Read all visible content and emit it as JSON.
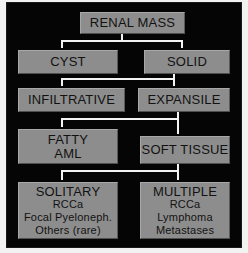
{
  "diagram": {
    "colors": {
      "background": "#050505",
      "node_fill": "#8d8d8d",
      "node_text": "#121212",
      "connector": "#f4f4f4",
      "page": "#ffffff"
    },
    "nodes": [
      {
        "id": "renal-mass",
        "name": "renal-mass",
        "main": "RENAL MASS",
        "sub": []
      },
      {
        "id": "cyst",
        "name": "cyst",
        "main": "CYST",
        "sub": []
      },
      {
        "id": "solid",
        "name": "solid",
        "main": "SOLID",
        "sub": []
      },
      {
        "id": "infiltrative",
        "name": "infiltrative",
        "main": "INFILTRATIVE",
        "sub": []
      },
      {
        "id": "expansile",
        "name": "expansile",
        "main": "EXPANSILE",
        "sub": []
      },
      {
        "id": "fatty-aml",
        "name": "fatty-aml",
        "main": "FATTY",
        "sub": [
          "AML"
        ]
      },
      {
        "id": "soft-tissue",
        "name": "soft-tissue",
        "main": "SOFT TISSUE",
        "sub": []
      },
      {
        "id": "solitary",
        "name": "solitary",
        "main": "SOLITARY",
        "sub": [
          "RCCa",
          "Focal Pyeloneph.",
          "Others (rare)"
        ]
      },
      {
        "id": "multiple",
        "name": "multiple",
        "main": "MULTIPLE",
        "sub": [
          "RCCa",
          "Lymphoma",
          "Metastases"
        ]
      }
    ],
    "edges": [
      {
        "from": "renal-mass",
        "to": "cyst"
      },
      {
        "from": "renal-mass",
        "to": "solid"
      },
      {
        "from": "solid",
        "to": "infiltrative"
      },
      {
        "from": "solid",
        "to": "expansile"
      },
      {
        "from": "expansile",
        "to": "fatty-aml"
      },
      {
        "from": "expansile",
        "to": "soft-tissue"
      },
      {
        "from": "soft-tissue",
        "to": "solitary"
      },
      {
        "from": "soft-tissue",
        "to": "multiple"
      }
    ]
  }
}
